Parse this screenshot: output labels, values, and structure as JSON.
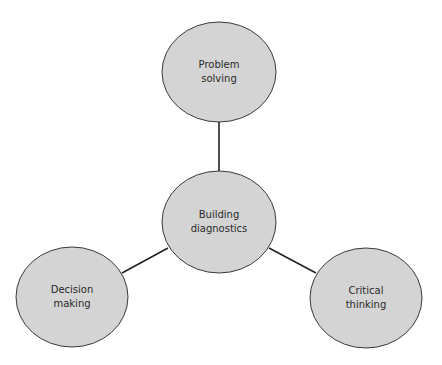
{
  "diagram": {
    "type": "hub-and-spoke",
    "colors": {
      "fill": "#d4d4d4",
      "stroke": "#3a3a3a",
      "connector": "#222222",
      "text": "#2a2a2a"
    },
    "center_node": {
      "id": "building-diagnostics",
      "lines": [
        "Building",
        "diagnostics"
      ],
      "cx": 219,
      "cy": 222,
      "rx": 57,
      "ry": 51
    },
    "nodes": [
      {
        "id": "problem-solving",
        "lines": [
          "Problem",
          "solving"
        ],
        "cx": 219,
        "cy": 72,
        "rx": 57,
        "ry": 50
      },
      {
        "id": "decision-making",
        "lines": [
          "Decision",
          "making"
        ],
        "cx": 72,
        "cy": 297,
        "rx": 56,
        "ry": 50
      },
      {
        "id": "critical-thinking",
        "lines": [
          "Critical",
          "thinking"
        ],
        "cx": 366,
        "cy": 298,
        "rx": 56,
        "ry": 50
      }
    ],
    "edges": [
      {
        "from": "building-diagnostics",
        "to": "problem-solving"
      },
      {
        "from": "building-diagnostics",
        "to": "decision-making"
      },
      {
        "from": "building-diagnostics",
        "to": "critical-thinking"
      }
    ]
  }
}
